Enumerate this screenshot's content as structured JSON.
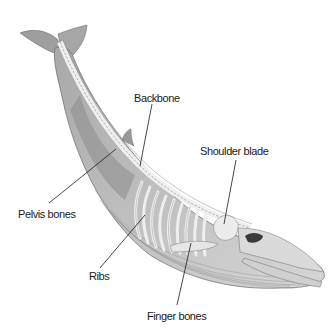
{
  "diagram": {
    "labels": [
      {
        "id": "backbone",
        "text": "Backbone"
      },
      {
        "id": "shoulder_blade",
        "text": "Shoulder blade"
      },
      {
        "id": "pelvis_bones",
        "text": "Pelvis bones"
      },
      {
        "id": "ribs",
        "text": "Ribs"
      },
      {
        "id": "finger_bones",
        "text": "Finger bones"
      }
    ],
    "colors": {
      "background": "#ffffff",
      "body_light": "#d9d9d9",
      "body_dark": "#8c8c8c",
      "leader_line": "#1a1a1a",
      "text": "#1a1a1a"
    }
  }
}
